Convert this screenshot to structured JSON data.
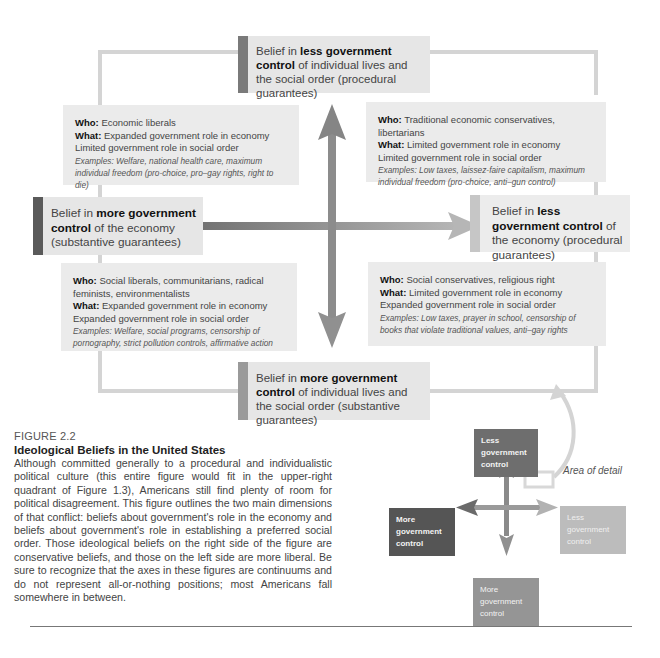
{
  "diagram": {
    "poles": {
      "top": {
        "prefix": "Belief in ",
        "bold": "less government control",
        "suffix": " of individual lives and the social order (procedural guarantees)"
      },
      "left": {
        "prefix": "Belief in ",
        "bold": "more government control",
        "suffix": " of the economy (substantive guarantees)"
      },
      "right": {
        "prefix": "Belief in ",
        "bold": "less government control",
        "suffix": " of the economy (procedural guarantees)"
      },
      "bottom": {
        "prefix": "Belief in ",
        "bold": "more government control",
        "suffix": " of individual lives and the social order (substantive guarantees)"
      }
    },
    "quadrants": {
      "upper_left": {
        "who_label": "Who:",
        "who": " Economic liberals",
        "what_label": "What:",
        "what1": " Expanded government role in economy",
        "what2": "Limited government role in social order",
        "examples": "Examples: Welfare, national health care, maximum individual freedom (pro-choice, pro–gay rights, right to die)"
      },
      "upper_right": {
        "who_label": "Who:",
        "who": " Traditional economic conservatives, libertarians",
        "what_label": "What:",
        "what1": " Limited government role in economy",
        "what2": "Limited government role in social order",
        "examples": "Examples: Low taxes, laissez-faire capitalism, maximum individual freedom (pro-choice, anti–gun control)"
      },
      "lower_left": {
        "who_label": "Who:",
        "who": " Social liberals, communitarians, radical feminists, environmentalists",
        "what_label": "What:",
        "what1": " Expanded government role in economy",
        "what2": "Expanded government role in social order",
        "examples": "Examples: Welfare, social programs, censorship of pornography, strict pollution controls, affirmative action"
      },
      "lower_right": {
        "who_label": "Who:",
        "who": " Social conservatives, religious right",
        "what_label": "What:",
        "what1": " Limited government role in economy",
        "what2": "Expanded government role in social order",
        "examples": "Examples: Low taxes, prayer in school, censorship of books that violate traditional values, anti–gay rights"
      }
    }
  },
  "caption": {
    "label": "FIGURE 2.2",
    "title": "Ideological Beliefs in the United States",
    "body": "Although committed generally to a procedural and individualistic political culture (this entire figure would fit in the upper-right quadrant of Figure 1.3), Americans still find plenty of room for political disagreement. This figure outlines the two main dimensions of that conflict: beliefs about government's role in the economy and beliefs about government's role in establishing a preferred social order. Those ideological beliefs on the right side of the figure are conservative beliefs, and those on the left side are more liberal. Be sure to recognize that the axes in these figures are continuums and do not represent all-or-nothing positions; most Americans fall somewhere in between."
  },
  "inset": {
    "top": "Less government control",
    "left": "More government control",
    "right": "Less government control",
    "bottom": "More government control",
    "area_label": "Area of detail"
  },
  "colors": {
    "pole_top_bar": "#7a7a7a",
    "pole_left_bar": "#5a5a5a",
    "pole_right_bar": "#c4c4c4",
    "pole_bottom_bar": "#9a9a9a",
    "arrow_vertical": "#8a8a8a",
    "arrow_horizontal_left": "#6e6e6e",
    "arrow_horizontal_right": "#b2b2b2",
    "frame": "#d4d4d4",
    "box_fill": "#e8e8e8"
  }
}
